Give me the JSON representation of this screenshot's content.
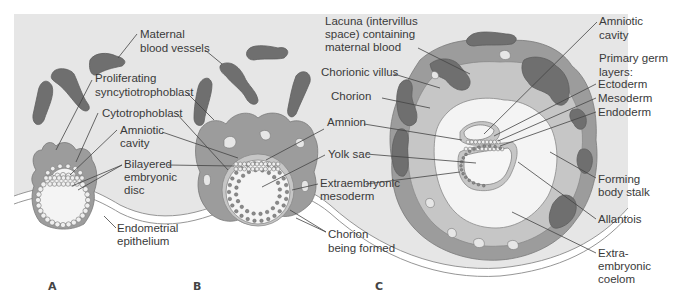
{
  "figure": {
    "panels": [
      {
        "id": "A",
        "letter": "A",
        "labels": [
          {
            "key": "maternal_blood_vessels",
            "lines": [
              "Maternal",
              "blood vessels"
            ]
          },
          {
            "key": "proliferating_syncytiotrophoblast",
            "lines": [
              "Proliferating",
              "syncytiotrophoblast"
            ]
          },
          {
            "key": "cytotrophoblast",
            "lines": [
              "Cytotrophoblast"
            ]
          },
          {
            "key": "amniotic_cavity",
            "lines": [
              "Amniotic",
              "cavity"
            ]
          },
          {
            "key": "bilayered_embryonic_disc",
            "lines": [
              "Bilayered",
              "embryonic",
              "disc"
            ]
          },
          {
            "key": "endometrial_epithelium",
            "lines": [
              "Endometrial",
              "epithelium"
            ]
          }
        ]
      },
      {
        "id": "B",
        "letter": "B",
        "labels": [
          {
            "key": "amnion",
            "lines": [
              "Amnion"
            ]
          },
          {
            "key": "yolk_sac",
            "lines": [
              "Yolk sac"
            ]
          },
          {
            "key": "extraembryonic_mesoderm",
            "lines": [
              "Extraembryonic",
              "mesoderm"
            ]
          },
          {
            "key": "chorion_being_formed",
            "lines": [
              "Chorion",
              "being formed"
            ]
          }
        ]
      },
      {
        "id": "C",
        "letter": "C",
        "labels": [
          {
            "key": "lacuna",
            "lines": [
              "Lacuna (intervillus",
              "space) containing",
              "maternal blood"
            ]
          },
          {
            "key": "chorionic_villus",
            "lines": [
              "Chorionic villus"
            ]
          },
          {
            "key": "chorion",
            "lines": [
              "Chorion"
            ]
          },
          {
            "key": "amniotic_cavity_c",
            "lines": [
              "Amniotic",
              "cavity"
            ]
          },
          {
            "key": "primary_germ_layers",
            "lines": [
              "Primary germ",
              "layers:"
            ]
          },
          {
            "key": "ectoderm",
            "lines": [
              "Ectoderm"
            ]
          },
          {
            "key": "mesoderm",
            "lines": [
              "Mesoderm"
            ]
          },
          {
            "key": "endoderm",
            "lines": [
              "Endoderm"
            ]
          },
          {
            "key": "forming_body_stalk",
            "lines": [
              "Forming",
              "body stalk"
            ]
          },
          {
            "key": "allantois",
            "lines": [
              "Allantois"
            ]
          },
          {
            "key": "extraembryonic_coelom",
            "lines": [
              "Extra-",
              "embryonic",
              "coelom"
            ]
          }
        ]
      }
    ],
    "colors": {
      "background_tissue": "#e6e6e6",
      "maternal_vessel": "#6f6f6f",
      "trophoblast": "#9c9c9c",
      "chorion": "#c6c6c6",
      "cavity": "#f4f4f4",
      "label_text": "#3a3a3a"
    }
  }
}
